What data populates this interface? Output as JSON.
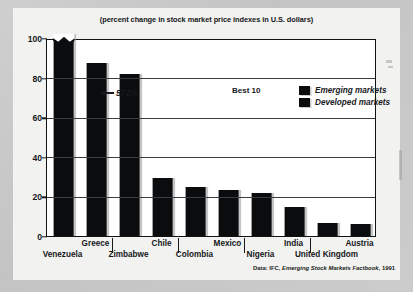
{
  "chart_data": {
    "type": "bar",
    "title": "(percent change in stock market price indexes in U.S. dollars)",
    "annotation_group": "Best 10",
    "xlabel": "",
    "ylabel": "",
    "ylim": [
      0,
      100
    ],
    "yticks": [
      0,
      20,
      40,
      60,
      80,
      100
    ],
    "grid": true,
    "legend_position": "top-right",
    "categories": [
      "Venezuela",
      "Greece",
      "Zimbabwe",
      "Chile",
      "Colombia",
      "Mexico",
      "Nigeria",
      "India",
      "United Kingdom",
      "Austria"
    ],
    "values": [
      572,
      87.5,
      82,
      29.5,
      25,
      23,
      21.5,
      14.5,
      6.5,
      6
    ],
    "displayed_values": [
      100,
      87.5,
      82,
      29.5,
      25,
      23,
      21.5,
      14.5,
      6.5,
      6
    ],
    "series": [
      {
        "name": "Emerging markets",
        "values": [
          572,
          87.5,
          82,
          29.5,
          25,
          23,
          21.5,
          14.5,
          null,
          null
        ]
      },
      {
        "name": "Developed markets",
        "values": [
          null,
          null,
          null,
          null,
          null,
          null,
          null,
          null,
          6.5,
          6
        ]
      }
    ],
    "bar_annotations": [
      {
        "category": "Venezuela",
        "label": "572%",
        "note": "bar axis-broken, drawn clipped at 100"
      }
    ],
    "legend": [
      {
        "label": "Emerging markets",
        "color": "#0b0c0e"
      },
      {
        "label": "Developed markets",
        "color": "#0b0c0e"
      }
    ],
    "source": {
      "prefix": "Data: IFC, ",
      "italic": "Emerging Stock Markets Factbook",
      "suffix": ", 1991"
    }
  },
  "colors": {
    "bar": "#0b0c0e",
    "frame": "#101214",
    "grid": "#3a3d40",
    "page": "#f2f2f0",
    "scan_background": "#c9c9c9"
  }
}
